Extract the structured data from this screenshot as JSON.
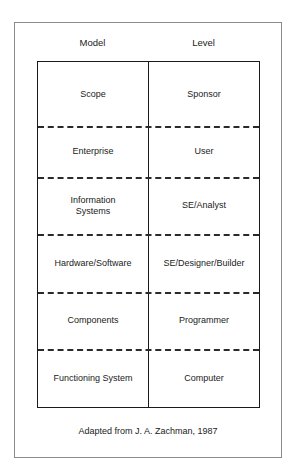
{
  "headers": {
    "model": "Model",
    "level": "Level"
  },
  "rows": [
    {
      "model": "Scope",
      "level": "Sponsor",
      "top": 0,
      "height": 64
    },
    {
      "model": "Enterprise",
      "level": "User",
      "top": 64,
      "height": 51
    },
    {
      "model": "Information\nSystems",
      "level": "SE/Analyst",
      "top": 115,
      "height": 57
    },
    {
      "model": "Hardware/Software",
      "level": "SE/Designer/Builder",
      "top": 172,
      "height": 58
    },
    {
      "model": "Components",
      "level": "Programmer",
      "top": 230,
      "height": 57
    },
    {
      "model": "Functioning System",
      "level": "Computer",
      "top": 287,
      "height": 58
    }
  ],
  "caption": "Adapted from J. A. Zachman, 1987"
}
